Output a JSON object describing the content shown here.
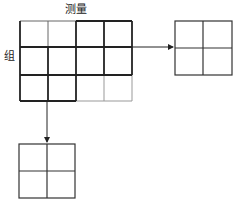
{
  "labels": {
    "measurement": "测量",
    "group": "组"
  },
  "main_grid": {
    "rows": 3,
    "cols": 4
  },
  "right_grid": {
    "rows": 2,
    "cols": 2
  },
  "bottom_grid": {
    "rows": 2,
    "cols": 2
  },
  "colors": {
    "line": "#222222",
    "light_line": "#888888"
  }
}
